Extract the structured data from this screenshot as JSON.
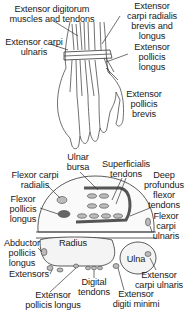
{
  "diagram": {
    "top_view": {
      "labels": [
        {
          "id": "ext-digitorum",
          "lines": [
            "Extensor digitorum",
            "muscles and tendons"
          ],
          "x": 6,
          "y": 4,
          "w": 92
        },
        {
          "id": "ext-carpi-radialis",
          "lines": [
            "Extensor",
            "carpi radialis",
            "brevis and",
            "longus"
          ],
          "x": 120,
          "y": 1,
          "w": 64
        },
        {
          "id": "ext-carpi-ulnaris",
          "lines": [
            "Extensor carpi",
            "ulnaris"
          ],
          "x": 2,
          "y": 37,
          "w": 64
        },
        {
          "id": "ext-pollicis-longus",
          "lines": [
            "Extensor",
            "pollicis",
            "longus"
          ],
          "x": 126,
          "y": 42,
          "w": 52
        },
        {
          "id": "ext-pollicis-brevis",
          "lines": [
            "Extensor",
            "pollicis",
            "brevis"
          ],
          "x": 118,
          "y": 89,
          "w": 52
        }
      ]
    },
    "cross_section": {
      "labels": [
        {
          "id": "ulnar-bursa",
          "lines": [
            "Ulnar",
            "bursa"
          ],
          "x": 60,
          "y": 152,
          "w": 36
        },
        {
          "id": "superficialis",
          "lines": [
            "Superficialis",
            "tendons"
          ],
          "x": 98,
          "y": 159,
          "w": 56
        },
        {
          "id": "deep-profundus",
          "lines": [
            "Deep",
            "profundus",
            "flexor",
            "tendons"
          ],
          "x": 142,
          "y": 170,
          "w": 44
        },
        {
          "id": "flexor-carpi-radialis",
          "lines": [
            "Flexor carpi",
            "radialis"
          ],
          "x": 6,
          "y": 170,
          "w": 58
        },
        {
          "id": "flexor-pollicis-longus",
          "lines": [
            "Flexor",
            "pollicis",
            "longus"
          ],
          "x": 4,
          "y": 194,
          "w": 38
        },
        {
          "id": "flexor-carpi-ulnaris",
          "lines": [
            "Flexor",
            "carpi",
            "ulnaris"
          ],
          "x": 146,
          "y": 211,
          "w": 40
        },
        {
          "id": "abductor-pollicis-longus",
          "lines": [
            "Abductor",
            "pollicis",
            "longus"
          ],
          "x": 0,
          "y": 238,
          "w": 44
        },
        {
          "id": "radius",
          "lines": [
            "Radius"
          ],
          "x": 55,
          "y": 238,
          "w": 36
        },
        {
          "id": "ulna",
          "lines": [
            "Ulna"
          ],
          "x": 124,
          "y": 254,
          "w": 24
        },
        {
          "id": "extensors",
          "lines": [
            "Extensors"
          ],
          "x": 4,
          "y": 269,
          "w": 50
        },
        {
          "id": "ext-carpi-ulnaris-2",
          "lines": [
            "Extensor",
            "carpi ulnaris"
          ],
          "x": 132,
          "y": 270,
          "w": 54
        },
        {
          "id": "digital-tendons",
          "lines": [
            "Digital",
            "tendons"
          ],
          "x": 74,
          "y": 277,
          "w": 40
        },
        {
          "id": "ext-pollicis-longus-2",
          "lines": [
            "Extensor",
            "pollicis longus"
          ],
          "x": 20,
          "y": 290,
          "w": 66
        },
        {
          "id": "ext-digiti-minimi",
          "lines": [
            "Extensor",
            "digiti minimi"
          ],
          "x": 108,
          "y": 289,
          "w": 56
        }
      ]
    }
  }
}
